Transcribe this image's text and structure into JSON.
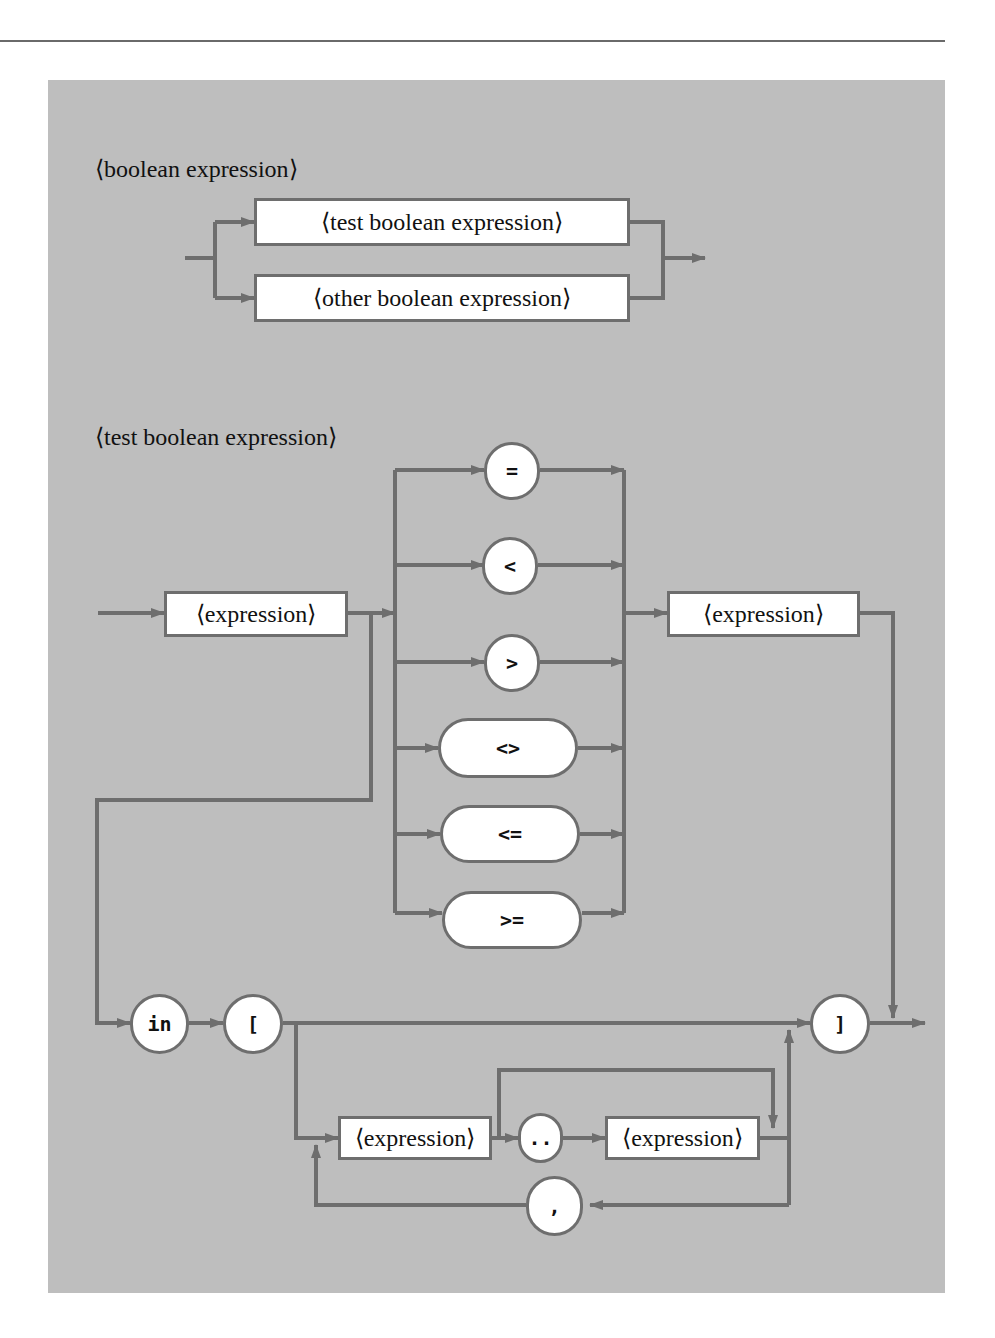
{
  "diagrams": [
    {
      "title": "⟨boolean expression⟩",
      "nonterminals": [
        "⟨test boolean expression⟩",
        "⟨other boolean expression⟩"
      ]
    },
    {
      "title": "⟨test boolean expression⟩",
      "nonterminals": {
        "left_expression": "⟨expression⟩",
        "right_expression": "⟨expression⟩",
        "range_start": "⟨expression⟩",
        "range_end": "⟨expression⟩"
      },
      "relational_operators": [
        "=",
        "<",
        ">",
        "<>",
        "<=",
        ">="
      ],
      "terminals": {
        "in": "in",
        "open_bracket": "[",
        "close_bracket": "]",
        "range_dots": "..",
        "comma": ","
      }
    }
  ],
  "colors": {
    "panel": "#bebebe",
    "line": "#6e6e6e",
    "box_fill": "#ffffff"
  }
}
